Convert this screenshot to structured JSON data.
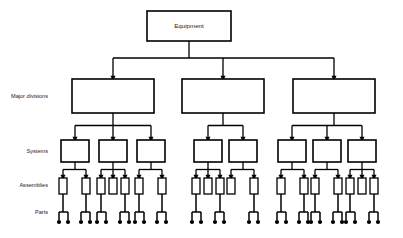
{
  "diagram": {
    "background_color": "#ffffff",
    "line_color": "#000000",
    "text_color": "#1a1a1a",
    "row_labels": [
      {
        "id": "major-divisions",
        "label": "Major divisions",
        "y": 97
      },
      {
        "id": "systems",
        "label": "Systems",
        "y": 152
      },
      {
        "id": "assemblies",
        "label": "Assemblies",
        "y": 186
      },
      {
        "id": "parts",
        "label": "Parts",
        "y": 213
      }
    ],
    "root": {
      "id": "equipment",
      "label": "Equipment",
      "x": 189,
      "y": 11,
      "width": 84,
      "height": 30
    },
    "levels": {
      "major_divisions": {
        "y": 79,
        "height": 34,
        "width": 82,
        "centers": [
          113,
          223,
          334
        ]
      },
      "systems": {
        "y": 140,
        "height": 22,
        "width": 28,
        "branches": [
          {
            "parent": 113,
            "centers": [
              75,
              113,
              151
            ]
          },
          {
            "parent": 223,
            "centers": [
              208,
              243
            ]
          },
          {
            "parent": 334,
            "centers": [
              292,
              327,
              362
            ]
          }
        ]
      },
      "assemblies": {
        "y": 178,
        "height": 16,
        "width": 8,
        "groups": [
          {
            "parent": 75,
            "centers": [
              63,
              86
            ]
          },
          {
            "parent": 113,
            "centers": [
              101,
              113,
              125
            ]
          },
          {
            "parent": 151,
            "centers": [
              139,
              162
            ]
          },
          {
            "parent": 208,
            "centers": [
              196,
              208,
              220
            ]
          },
          {
            "parent": 243,
            "centers": [
              231,
              254
            ]
          },
          {
            "parent": 292,
            "centers": [
              281,
              304
            ]
          },
          {
            "parent": 327,
            "centers": [
              315,
              338
            ]
          },
          {
            "parent": 362,
            "centers": [
              350,
              362,
              374
            ]
          }
        ]
      },
      "parts": {
        "y": 222,
        "stem_top": 205,
        "bar_y": 212,
        "dot_radius": 2.1,
        "groups": [
          {
            "parent": 63,
            "dots": [
              59,
              68
            ]
          },
          {
            "parent": 86,
            "dots": [
              81,
              90
            ]
          },
          {
            "parent": 101,
            "dots": [
              97,
              106
            ]
          },
          {
            "parent": 125,
            "dots": [
              120,
              129
            ]
          },
          {
            "parent": 139,
            "dots": [
              135,
              144
            ]
          },
          {
            "parent": 162,
            "dots": [
              157,
              166
            ]
          },
          {
            "parent": 196,
            "dots": [
              192,
              201
            ]
          },
          {
            "parent": 220,
            "dots": [
              215,
              224
            ]
          },
          {
            "parent": 254,
            "dots": [
              249,
              258
            ]
          },
          {
            "parent": 281,
            "dots": [
              277,
              286
            ]
          },
          {
            "parent": 304,
            "dots": [
              299,
              308
            ]
          },
          {
            "parent": 315,
            "dots": [
              311,
              320
            ]
          },
          {
            "parent": 338,
            "dots": [
              333,
              342
            ]
          },
          {
            "parent": 350,
            "dots": [
              346,
              355
            ]
          },
          {
            "parent": 374,
            "dots": [
              369,
              378
            ]
          }
        ]
      }
    },
    "stroke_widths": {
      "box": 1.6,
      "small_box": 1.3,
      "connector": 1.3,
      "stem": 1.5
    },
    "counts": {
      "major_divisions": 3,
      "systems": 8,
      "assemblies": 19,
      "part_groups": 15
    }
  }
}
